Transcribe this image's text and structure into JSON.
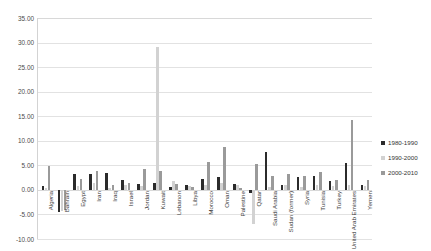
{
  "chart_data": {
    "type": "bar",
    "title": "",
    "xlabel": "",
    "ylabel": "",
    "ylim": [
      -10,
      35
    ],
    "ytick_step": 5,
    "ytick_labels": [
      "35.00",
      "30.00",
      "25.00",
      "20.00",
      "15.00",
      "10.00",
      "5.00",
      "0.00",
      "-5.00",
      "-10.00"
    ],
    "ytick_values": [
      35,
      30,
      25,
      20,
      15,
      10,
      5,
      0,
      -5,
      -10
    ],
    "grid": true,
    "legend_position": "right",
    "categories": [
      "Algeria",
      "Bahrain",
      "Egypt",
      "Iran",
      "Iraq",
      "Israel",
      "Jordan",
      "Kuwait",
      "Lebanon",
      "Libya",
      "Morocco",
      "Oman",
      "Palestine",
      "Qatar",
      "Saudi Arabia",
      "Sudan (former)",
      "Syria",
      "Tunisia",
      "Turkey",
      "United Arab Emirates",
      "Yemen"
    ],
    "series": [
      {
        "name": "1980-1990",
        "color": "#2b2b2b",
        "values": [
          0.8,
          -4.6,
          3.3,
          3.2,
          3.5,
          2.1,
          1.1,
          1.4,
          0.5,
          1.0,
          2.2,
          2.6,
          1.3,
          -0.6,
          7.8,
          0.9,
          2.6,
          2.8,
          1.9,
          5.5,
          1.0
        ]
      },
      {
        "name": "1990-2000",
        "color": "#d2d2d2",
        "values": [
          0.3,
          -4.2,
          0.8,
          1.5,
          0.4,
          0.9,
          0.7,
          29.0,
          1.8,
          0.7,
          0.9,
          1.4,
          1.0,
          -7.0,
          0.6,
          0.9,
          0.6,
          0.9,
          0.8,
          0.9,
          0.7
        ]
      },
      {
        "name": "2000-2010",
        "color": "#9a9a9a",
        "values": [
          4.8,
          -4.0,
          2.3,
          3.9,
          0.9,
          1.4,
          4.3,
          3.8,
          1.2,
          0.6,
          5.6,
          8.8,
          0.4,
          5.3,
          2.9,
          3.2,
          2.8,
          3.6,
          2.1,
          14.2,
          2.0
        ]
      }
    ]
  },
  "legend": {
    "items": [
      {
        "label": "1980-1990",
        "color": "#2b2b2b"
      },
      {
        "label": "1990-2000",
        "color": "#d2d2d2"
      },
      {
        "label": "2000-2010",
        "color": "#9a9a9a"
      }
    ]
  }
}
